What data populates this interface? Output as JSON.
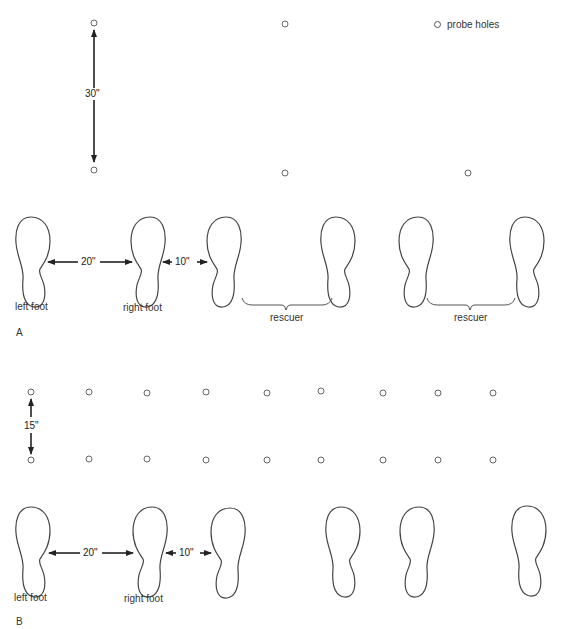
{
  "legend": {
    "label": "probe holes",
    "icon": "probe-hole-icon"
  },
  "panel_a": {
    "label": "A",
    "vertical_spacing": "30\"",
    "horizontal_gap_feet": "20\"",
    "gap_to_rescuer": "10\"",
    "foot_labels": {
      "left": "left foot",
      "right": "right foot"
    },
    "rescuer_labels": [
      "rescuer",
      "rescuer"
    ],
    "holes_per_row": 3
  },
  "panel_b": {
    "label": "B",
    "vertical_spacing": "15\"",
    "horizontal_gap_feet": "20\"",
    "gap_to_rescuer": "10\"",
    "foot_labels": {
      "left": "left foot",
      "right": "right foot"
    },
    "holes_per_row": 9
  }
}
